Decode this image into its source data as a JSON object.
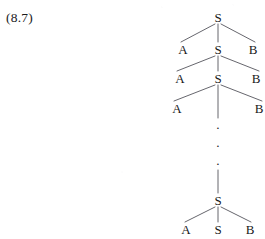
{
  "figure": {
    "equation_number": "(8.7)",
    "description_kind": "recursive-phrase-structure-tree"
  },
  "tree": {
    "root_symbol": "S",
    "expansion_rule": "S → A S B",
    "nodes": {
      "root": {
        "symbol": "S",
        "x": 218,
        "y": 17
      },
      "level1": [
        {
          "symbol": "A",
          "x": 183,
          "y": 49
        },
        {
          "symbol": "S",
          "x": 218,
          "y": 49
        },
        {
          "symbol": "B",
          "x": 253,
          "y": 49
        }
      ],
      "level2": [
        {
          "symbol": "A",
          "x": 180,
          "y": 78
        },
        {
          "symbol": "S",
          "x": 218,
          "y": 78
        },
        {
          "symbol": "B",
          "x": 256,
          "y": 78
        }
      ],
      "level3": [
        {
          "symbol": "A",
          "x": 177,
          "y": 108
        },
        {
          "symbol": "B",
          "x": 259,
          "y": 108
        }
      ],
      "ellipsis_dots": [
        {
          "symbol": "·",
          "x": 218,
          "y": 127
        },
        {
          "symbol": "·",
          "x": 218,
          "y": 145
        },
        {
          "symbol": "·",
          "x": 218,
          "y": 163
        }
      ],
      "lower_node": {
        "symbol": "S",
        "x": 218,
        "y": 200
      },
      "leaf_level": [
        {
          "symbol": "A",
          "x": 186,
          "y": 229
        },
        {
          "symbol": "S",
          "x": 218,
          "y": 229
        },
        {
          "symbol": "B",
          "x": 250,
          "y": 229
        }
      ]
    },
    "symbols": {
      "start": "S",
      "left_terminal": "A",
      "right_terminal": "B",
      "ellipsis": "·"
    }
  },
  "style": {
    "ink_color": "#17171a",
    "line_color": "#55555c",
    "background_color": "#ffffff",
    "line_width": 0.9
  }
}
